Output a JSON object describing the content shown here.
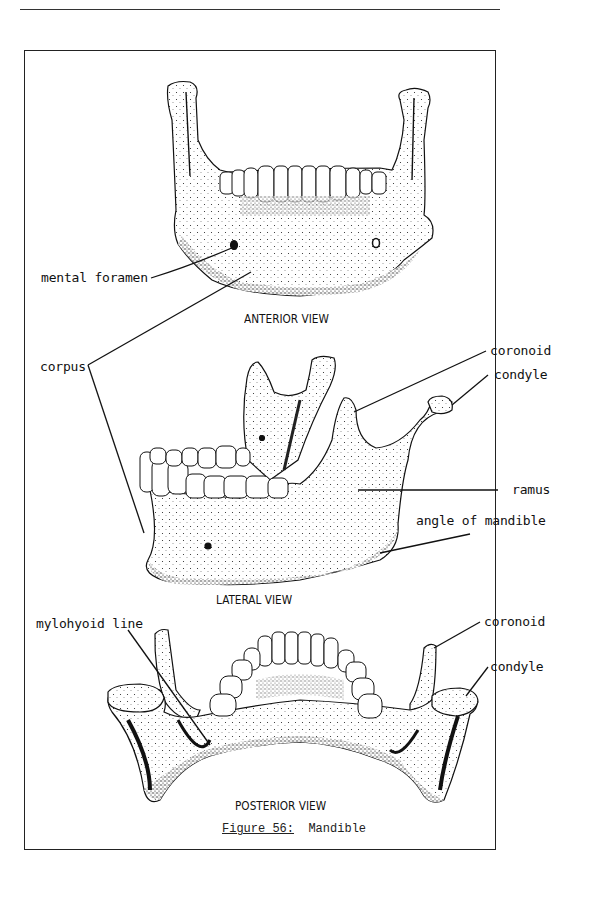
{
  "figure": {
    "number_label": "Figure 56:",
    "title": "Mandible"
  },
  "views": {
    "anterior": {
      "title": "ANTERIOR VIEW",
      "labels": {
        "mental_foramen": "mental foramen"
      }
    },
    "lateral": {
      "title": "LATERAL VIEW",
      "labels": {
        "corpus": "corpus",
        "coronoid": "coronoid",
        "condyle": "condyle",
        "ramus": "ramus",
        "angle_of_mandible": "angle of mandible"
      }
    },
    "posterior": {
      "title": "POSTERIOR VIEW",
      "labels": {
        "mylohyoid_line": "mylohyoid line",
        "coronoid": "coronoid",
        "condyle": "condyle"
      }
    }
  },
  "colors": {
    "ink": "#111111",
    "paper": "#ffffff"
  }
}
